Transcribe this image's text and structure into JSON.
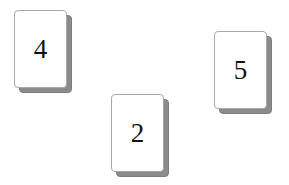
{
  "scene": {
    "background_color": "#ffffff",
    "width": 289,
    "height": 185,
    "description": "Three playing-card tiles with numbers, each drawn with a gray drop-shadow card behind it"
  },
  "card_style": {
    "face_color": "#ffffff",
    "border_color": "#a8a8a8",
    "shadow_color": "#8b8b8b",
    "text_color": "#111111"
  },
  "cards": [
    {
      "value": "4",
      "x": 14,
      "y": 10,
      "width": 53,
      "height": 78
    },
    {
      "value": "2",
      "x": 111,
      "y": 94,
      "width": 53,
      "height": 78
    },
    {
      "value": "5",
      "x": 214,
      "y": 31,
      "width": 53,
      "height": 78
    }
  ]
}
